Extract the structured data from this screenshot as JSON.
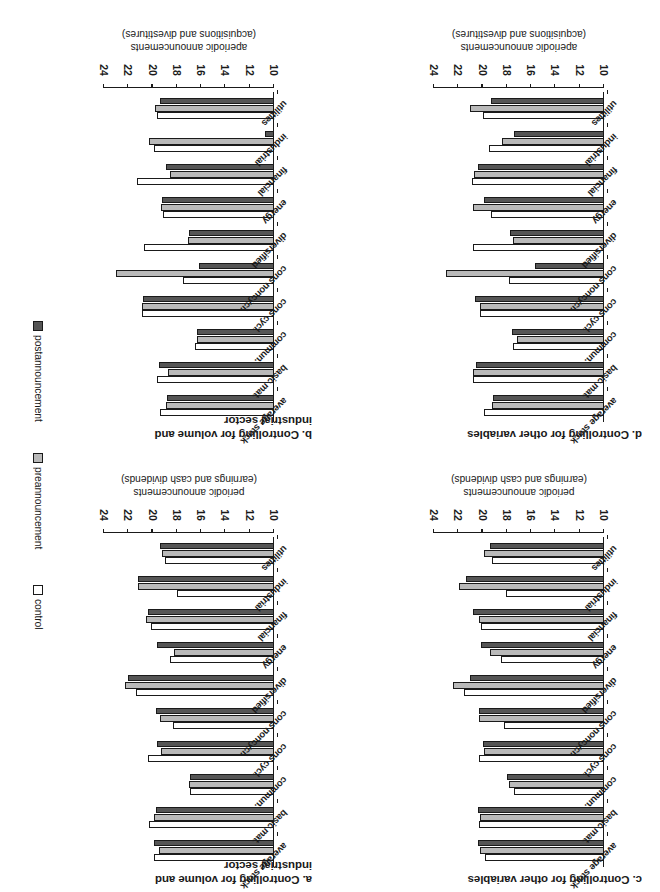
{
  "figure": {
    "rotation_degrees": 180,
    "legend": {
      "entries": [
        {
          "label": "control",
          "color": "#ffffff",
          "swatch": "legend-swatch-control"
        },
        {
          "label": "preannouncement",
          "color": "#b9b9b9",
          "swatch": "legend-swatch-preannouncement"
        },
        {
          "label": "postannouncement",
          "color": "#555555",
          "swatch": "legend-swatch-postannouncement"
        }
      ]
    }
  },
  "chart_data": [
    {
      "id": "a",
      "type": "bar",
      "title": "a. Controlling for volume and industrial sector",
      "title_lines": [
        "a. Controlling for volume and",
        "industrial sector"
      ],
      "xlabel": "",
      "ylabel": "periodic announcements (earnings and cash dividends)",
      "ylabel_lines": [
        "periodic announcements",
        "(earnings and cash dividends)"
      ],
      "ylim": [
        10,
        24
      ],
      "yticks": [
        10,
        12,
        14,
        16,
        18,
        20,
        22,
        24
      ],
      "ytick_labels": [
        "10",
        "12",
        "14",
        "16",
        "18",
        "20",
        "22",
        "24"
      ],
      "grid": false,
      "categories": [
        "average stock",
        "basic mat.",
        "commun.",
        "cons cycl.",
        "cons noncycl.",
        "diversified",
        "energy",
        "financial",
        "industrial",
        "utilities"
      ],
      "series": [
        {
          "name": "control",
          "values": [
            19.9,
            20.3,
            16.9,
            20.4,
            18.3,
            21.4,
            18.6,
            20.1,
            18.0,
            19.0
          ]
        },
        {
          "name": "preannouncement",
          "values": [
            19.5,
            19.9,
            17.0,
            19.3,
            19.4,
            22.3,
            18.2,
            20.5,
            21.2,
            19.2
          ]
        },
        {
          "name": "postannouncement",
          "values": [
            19.9,
            19.7,
            16.9,
            19.6,
            19.7,
            22.0,
            19.6,
            20.4,
            21.2,
            19.4
          ]
        }
      ]
    },
    {
      "id": "b",
      "type": "bar",
      "title": "b. Controlling for volume and industrial sector",
      "title_lines": [
        "b. Controlling for volume and",
        "industrial sector"
      ],
      "xlabel": "",
      "ylabel": "aperiodic announcements (acquisitions and divestitures)",
      "ylabel_lines": [
        "aperiodic announcements",
        "(acquisitions and divestitures)"
      ],
      "ylim": [
        10,
        24
      ],
      "yticks": [
        10,
        12,
        14,
        16,
        18,
        20,
        22,
        24
      ],
      "ytick_labels": [
        "10",
        "12",
        "14",
        "16",
        "18",
        "20",
        "22",
        "24"
      ],
      "grid": false,
      "categories": [
        "average stock",
        "basic mat.",
        "commun.",
        "cons cycl.",
        "cons noncycl.",
        "diversified",
        "energy",
        "financial",
        "industrial",
        "utilities"
      ],
      "series": [
        {
          "name": "control",
          "values": [
            19.4,
            19.6,
            16.5,
            20.9,
            17.5,
            20.7,
            19.1,
            21.3,
            19.9,
            19.6
          ]
        },
        {
          "name": "preannouncement",
          "values": [
            18.9,
            18.7,
            16.3,
            20.9,
            23.0,
            17.1,
            19.3,
            18.6,
            20.3,
            19.8
          ]
        },
        {
          "name": "postannouncement",
          "values": [
            18.8,
            19.5,
            16.3,
            20.8,
            16.2,
            17.0,
            19.2,
            18.9,
            10.7,
            19.4
          ]
        }
      ]
    },
    {
      "id": "c",
      "type": "bar",
      "title": "c. Controlling for other variables",
      "title_lines": [
        "c. Controlling for other variables"
      ],
      "xlabel": "",
      "ylabel": "periodic announcements (earnings and cash dividends)",
      "ylabel_lines": [
        "periodic announcements",
        "(earnings and cash dividends)"
      ],
      "ylim": [
        10,
        24
      ],
      "yticks": [
        10,
        12,
        14,
        16,
        18,
        20,
        22,
        24
      ],
      "ytick_labels": [
        "10",
        "12",
        "14",
        "16",
        "18",
        "20",
        "22",
        "24"
      ],
      "grid": false,
      "categories": [
        "average stock",
        "basic mat.",
        "commun.",
        "cons cycl.",
        "cons noncycl.",
        "diversified",
        "energy",
        "financial",
        "industrial",
        "utilities"
      ],
      "series": [
        {
          "name": "control",
          "values": [
            19.8,
            20.3,
            17.4,
            20.3,
            18.2,
            21.5,
            18.5,
            20.1,
            18.1,
            19.2
          ]
        },
        {
          "name": "preannouncement",
          "values": [
            20.2,
            20.2,
            17.8,
            19.9,
            20.3,
            22.4,
            19.4,
            20.3,
            21.9,
            19.9
          ]
        },
        {
          "name": "postannouncement",
          "values": [
            20.4,
            20.4,
            18.0,
            20.0,
            20.3,
            21.0,
            20.1,
            20.8,
            21.4,
            19.4
          ]
        }
      ]
    },
    {
      "id": "d",
      "type": "bar",
      "title": "d. Controlling for other variables",
      "title_lines": [
        "d. Controlling for other variables"
      ],
      "xlabel": "",
      "ylabel": "aperiodic announcements (acquisitions and divestitures)",
      "ylabel_lines": [
        "aperiodic announcements",
        "(acquisitions and divestitures)"
      ],
      "ylim": [
        10,
        24
      ],
      "yticks": [
        10,
        12,
        14,
        16,
        18,
        20,
        22,
        24
      ],
      "ytick_labels": [
        "10",
        "12",
        "14",
        "16",
        "18",
        "20",
        "22",
        "24"
      ],
      "grid": false,
      "categories": [
        "average stock",
        "basic mat.",
        "commun.",
        "cons cycl.",
        "cons noncycl.",
        "diversified",
        "energy",
        "financial",
        "industrial",
        "utilities"
      ],
      "series": [
        {
          "name": "control",
          "values": [
            19.9,
            20.8,
            17.5,
            20.2,
            17.8,
            20.8,
            19.3,
            20.9,
            19.5,
            20.0
          ]
        },
        {
          "name": "preannouncement",
          "values": [
            19.2,
            20.8,
            17.2,
            20.2,
            23.0,
            17.5,
            20.8,
            20.7,
            18.4,
            21.0
          ]
        },
        {
          "name": "postannouncement",
          "values": [
            19.1,
            20.5,
            17.6,
            20.6,
            15.7,
            17.7,
            19.9,
            20.4,
            17.4,
            19.3
          ]
        }
      ]
    }
  ]
}
